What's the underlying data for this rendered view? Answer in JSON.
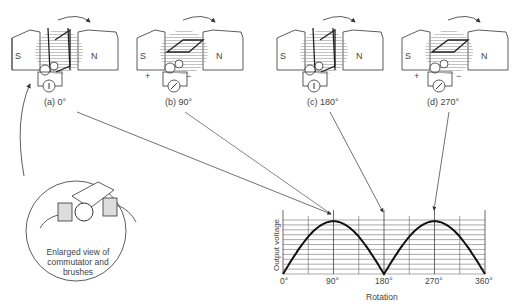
{
  "panels": [
    {
      "id": "a",
      "label": "(a)  0°",
      "angle_deg": 0,
      "pole_left": "S",
      "pole_right": "N",
      "polarity_plus": "",
      "polarity_minus": ""
    },
    {
      "id": "b",
      "label": "(b)  90°",
      "angle_deg": 90,
      "pole_left": "S",
      "pole_right": "N",
      "polarity_plus": "+",
      "polarity_minus": "−"
    },
    {
      "id": "c",
      "label": "(c)  180°",
      "angle_deg": 180,
      "pole_left": "S",
      "pole_right": "N",
      "polarity_plus": "",
      "polarity_minus": ""
    },
    {
      "id": "d",
      "label": "(d)  270°",
      "angle_deg": 270,
      "pole_left": "S",
      "pole_right": "N",
      "polarity_plus": "+",
      "polarity_minus": "−"
    }
  ],
  "inset": {
    "caption_line1": "Enlarged view of",
    "caption_line2": "commutator and",
    "caption_line3": "brushes"
  },
  "chart_data": {
    "type": "line",
    "title": "",
    "xlabel": "Rotation",
    "ylabel": "Output voltage",
    "x_ticks": [
      "0°",
      "90°",
      "180°",
      "270°",
      "360°"
    ],
    "x": [
      0,
      45,
      90,
      135,
      180,
      225,
      270,
      315,
      360
    ],
    "series": [
      {
        "name": "Output voltage (rectified)",
        "values": [
          0,
          0.71,
          1,
          0.71,
          0,
          0.71,
          1,
          0.71,
          0
        ]
      }
    ],
    "xlim": [
      0,
      360
    ],
    "ylim": [
      0,
      1.1
    ],
    "grid": true
  }
}
